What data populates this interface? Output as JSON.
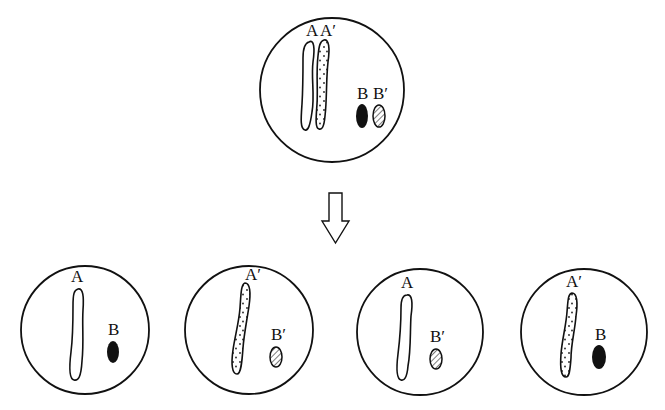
{
  "diagram": {
    "type": "meiosis-chromosome-segregation",
    "colors": {
      "stroke": "#111111",
      "background": "#ffffff",
      "solid_fill": "#111111"
    },
    "parent_cell": {
      "labels": {
        "a": "A",
        "a_prime": "A′",
        "b": "B",
        "b_prime": "B′"
      },
      "chromosomes": [
        {
          "label": "A",
          "pattern": "empty"
        },
        {
          "label": "A′",
          "pattern": "dotted"
        },
        {
          "label": "B",
          "pattern": "solid"
        },
        {
          "label": "B′",
          "pattern": "hatched"
        }
      ]
    },
    "arrow": {
      "direction": "down"
    },
    "daughter_cells": [
      {
        "long_label": "A",
        "short_label": "B",
        "long_pattern": "empty",
        "short_pattern": "solid"
      },
      {
        "long_label": "A′",
        "short_label": "B′",
        "long_pattern": "dotted",
        "short_pattern": "hatched"
      },
      {
        "long_label": "A",
        "short_label": "B′",
        "long_pattern": "empty",
        "short_pattern": "hatched"
      },
      {
        "long_label": "A′",
        "short_label": "B",
        "long_pattern": "dotted",
        "short_pattern": "solid"
      }
    ]
  }
}
